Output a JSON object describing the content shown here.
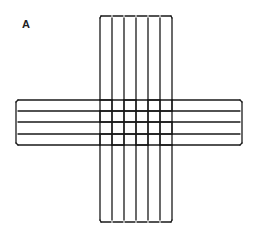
{
  "figure": {
    "panel_label": "A",
    "stroke_color": "#1a1a1a",
    "vertical_strips": {
      "count": 6,
      "x_bounds": [
        100,
        112,
        124,
        136,
        148,
        160,
        172
      ],
      "top": 16,
      "bottom": 222
    },
    "horizontal_strips": {
      "count": 4,
      "y_bounds": [
        100,
        111,
        122,
        134,
        145
      ],
      "left": 16,
      "right": 242
    }
  }
}
